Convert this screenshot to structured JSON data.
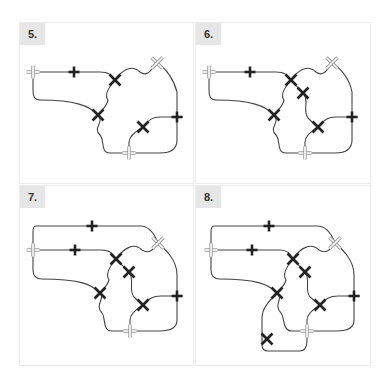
{
  "panels": [
    {
      "id": "p5",
      "label": "5.",
      "box": [
        19,
        22,
        175,
        162
      ],
      "markers": [
        {
          "type": "hollow-plus",
          "x": 33,
          "y": 72
        },
        {
          "type": "plus",
          "x": 74,
          "y": 72
        },
        {
          "type": "x",
          "x": 115,
          "y": 80
        },
        {
          "type": "hollow-x",
          "x": 157,
          "y": 63
        },
        {
          "type": "x",
          "x": 98,
          "y": 115
        },
        {
          "type": "plus",
          "x": 177,
          "y": 117
        },
        {
          "type": "x",
          "x": 143,
          "y": 127
        },
        {
          "type": "hollow-plus",
          "x": 129,
          "y": 153
        }
      ]
    },
    {
      "id": "p6",
      "label": "6.",
      "box": [
        195,
        22,
        176,
        162
      ],
      "markers": [
        {
          "type": "hollow-plus",
          "x": 209,
          "y": 72
        },
        {
          "type": "plus",
          "x": 250,
          "y": 72
        },
        {
          "type": "x",
          "x": 291,
          "y": 80
        },
        {
          "type": "x",
          "x": 303,
          "y": 93
        },
        {
          "type": "hollow-x",
          "x": 332,
          "y": 63
        },
        {
          "type": "x",
          "x": 274,
          "y": 115
        },
        {
          "type": "plus",
          "x": 352,
          "y": 117
        },
        {
          "type": "x",
          "x": 318,
          "y": 127
        },
        {
          "type": "hollow-plus",
          "x": 305,
          "y": 153
        }
      ]
    },
    {
      "id": "p7",
      "label": "7.",
      "box": [
        19,
        185,
        175,
        181
      ],
      "markers": [
        {
          "type": "plus",
          "x": 92,
          "y": 226
        },
        {
          "type": "hollow-plus",
          "x": 33,
          "y": 250
        },
        {
          "type": "plus",
          "x": 75,
          "y": 250
        },
        {
          "type": "x",
          "x": 116,
          "y": 259
        },
        {
          "type": "x",
          "x": 129,
          "y": 272
        },
        {
          "type": "hollow-x",
          "x": 158,
          "y": 243
        },
        {
          "type": "x",
          "x": 100,
          "y": 293
        },
        {
          "type": "plus",
          "x": 177,
          "y": 296
        },
        {
          "type": "x",
          "x": 143,
          "y": 305
        },
        {
          "type": "hollow-plus",
          "x": 130,
          "y": 331
        }
      ]
    },
    {
      "id": "p8",
      "label": "8.",
      "box": [
        195,
        185,
        176,
        181
      ],
      "markers": [
        {
          "type": "plus",
          "x": 269,
          "y": 226
        },
        {
          "type": "hollow-plus",
          "x": 211,
          "y": 250
        },
        {
          "type": "plus",
          "x": 252,
          "y": 250
        },
        {
          "type": "x",
          "x": 293,
          "y": 259
        },
        {
          "type": "x",
          "x": 305,
          "y": 272
        },
        {
          "type": "hollow-x",
          "x": 335,
          "y": 243
        },
        {
          "type": "x",
          "x": 277,
          "y": 293
        },
        {
          "type": "plus",
          "x": 354,
          "y": 296
        },
        {
          "type": "x",
          "x": 320,
          "y": 305
        },
        {
          "type": "hollow-plus",
          "x": 307,
          "y": 331
        },
        {
          "type": "x",
          "x": 267,
          "y": 339
        }
      ]
    }
  ],
  "colors": {
    "track": "#444444",
    "marker": "#222222",
    "hollow": "#999999",
    "label_bg": "#e6e6e6",
    "border": "#ececec"
  }
}
